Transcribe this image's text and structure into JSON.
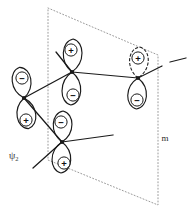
{
  "figure": {
    "background_color": "#ffffff",
    "stroke_color": "#1a1a1a",
    "plane_color": "#9a9a9a",
    "width": 191,
    "height": 220
  },
  "labels": {
    "wavefunction": "ψ",
    "wavefunction_subscript": "2",
    "mirror_plane": "m"
  },
  "symmetry_plane": {
    "name": "mirror-plane",
    "label": "m",
    "style": "dotted",
    "color": "#9a9a9a",
    "corners": [
      {
        "x": 48,
        "y": 8
      },
      {
        "x": 158,
        "y": 55
      },
      {
        "x": 158,
        "y": 205
      },
      {
        "x": 48,
        "y": 160
      }
    ],
    "label_position": {
      "x": 165,
      "y": 138
    }
  },
  "orbitals": [
    {
      "id": "orbital-1",
      "name": "p-orbital-left",
      "center": {
        "x": 24,
        "y": 98
      },
      "tilt_deg": -8,
      "lobe_height": 31,
      "lobe_width": 21,
      "top_sign": "−",
      "bottom_sign": "+",
      "top_sign_position": {
        "x": 22,
        "y": 78
      },
      "bottom_sign_position": {
        "x": 26,
        "y": 120
      },
      "dashed_top_lobe": false
    },
    {
      "id": "orbital-2",
      "name": "p-orbital-upper-middle",
      "center": {
        "x": 72,
        "y": 72
      },
      "tilt_deg": 2,
      "lobe_height": 33,
      "lobe_width": 21,
      "top_sign": "+",
      "bottom_sign": "−",
      "top_sign_position": {
        "x": 71,
        "y": 50
      },
      "bottom_sign_position": {
        "x": 73,
        "y": 95
      },
      "dashed_top_lobe": false
    },
    {
      "id": "orbital-3",
      "name": "p-orbital-lower-middle",
      "center": {
        "x": 62,
        "y": 142
      },
      "tilt_deg": 2,
      "lobe_height": 31,
      "lobe_width": 21,
      "top_sign": "−",
      "bottom_sign": "+",
      "top_sign_position": {
        "x": 61,
        "y": 122
      },
      "bottom_sign_position": {
        "x": 64,
        "y": 163
      },
      "dashed_top_lobe": false
    },
    {
      "id": "orbital-4",
      "name": "p-orbital-right",
      "center": {
        "x": 138,
        "y": 78
      },
      "tilt_deg": 3,
      "lobe_height": 31,
      "lobe_width": 21,
      "top_sign": "+",
      "bottom_sign": "−",
      "top_sign_position": {
        "x": 138,
        "y": 58
      },
      "bottom_sign_position": {
        "x": 137,
        "y": 100
      },
      "dashed_top_lobe": true
    }
  ],
  "bonds": [
    {
      "id": "bond-1",
      "name": "bond-left-to-upper",
      "from": {
        "x": 24,
        "y": 98
      },
      "to": {
        "x": 72,
        "y": 72
      }
    },
    {
      "id": "bond-2",
      "name": "bond-left-to-lower",
      "from": {
        "x": 24,
        "y": 98
      },
      "to": {
        "x": 62,
        "y": 142
      }
    },
    {
      "id": "bond-3",
      "name": "bond-upper-to-right",
      "from": {
        "x": 72,
        "y": 72
      },
      "to": {
        "x": 138,
        "y": 78
      }
    }
  ],
  "substituents": [
    {
      "id": "sub-1",
      "name": "substituent-upper-left",
      "from": {
        "x": 72,
        "y": 72
      },
      "to": {
        "x": 56,
        "y": 52
      }
    },
    {
      "id": "sub-2",
      "name": "substituent-right-upper",
      "from": {
        "x": 138,
        "y": 78
      },
      "to": {
        "x": 162,
        "y": 66
      }
    },
    {
      "id": "sub-3",
      "name": "substituent-right-outer",
      "from": {
        "x": 170,
        "y": 62
      },
      "to": {
        "x": 186,
        "y": 58
      }
    },
    {
      "id": "sub-4",
      "name": "substituent-lower-right",
      "from": {
        "x": 62,
        "y": 142
      },
      "to": {
        "x": 113,
        "y": 135
      }
    },
    {
      "id": "sub-5",
      "name": "substituent-lower-left",
      "from": {
        "x": 62,
        "y": 142
      },
      "to": {
        "x": 33,
        "y": 168
      }
    }
  ],
  "nodes": [
    {
      "id": "node-1",
      "name": "orbital-node-left",
      "x": 24,
      "y": 98
    },
    {
      "id": "node-2",
      "name": "orbital-node-upper-middle",
      "x": 72,
      "y": 72
    },
    {
      "id": "node-3",
      "name": "orbital-node-lower-middle",
      "x": 62,
      "y": 142
    },
    {
      "id": "node-4",
      "name": "orbital-node-right",
      "x": 138,
      "y": 78
    }
  ],
  "psi_label_position": {
    "x": 9,
    "y": 155
  }
}
